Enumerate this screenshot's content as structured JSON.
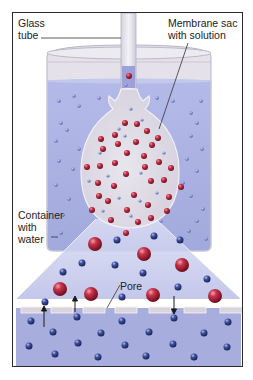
{
  "labels": {
    "glass_tube": "Glass\ntube",
    "membrane_sac": "Membrane sac\nwith solution",
    "container": "Container\nwith\nwater",
    "pore": "Pore"
  },
  "colors": {
    "water": "#a9b0e0",
    "water_light": "#c5c9ec",
    "membrane": "#e6e2e8",
    "solute": "#b0243a",
    "water_molecule": "#3a4a94",
    "frame": "#2a2a2a",
    "pore_strip": "#d9d4dc"
  },
  "annotations": {
    "arrows": [
      {
        "direction": "up",
        "x": 43,
        "from_y": 326,
        "to_y": 306
      },
      {
        "direction": "up",
        "x": 74,
        "from_y": 311,
        "to_y": 296
      },
      {
        "direction": "down",
        "x": 173,
        "from_y": 295,
        "to_y": 313
      }
    ]
  }
}
